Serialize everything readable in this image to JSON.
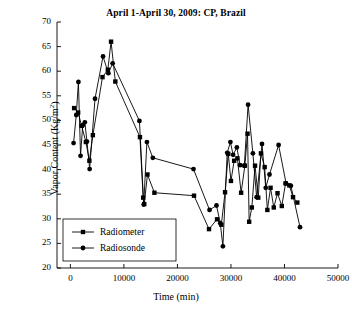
{
  "chart_data": {
    "type": "line",
    "title": "April 1-April 30, 2009: CP, Brazil",
    "xlabel": "Time (min)",
    "ylabel": "Vapor Content (Kg/m²)",
    "ylabel_main": "Vapor Content (Kg/m",
    "ylabel_sup": "2",
    "ylabel_tail": ")",
    "xlim": [
      -2500,
      50000
    ],
    "ylim": [
      20,
      70
    ],
    "grid": false,
    "legend_position": "lower-left",
    "xticks": [
      0,
      10000,
      20000,
      30000,
      40000,
      50000
    ],
    "xtick_labels": [
      "0",
      "10000",
      "20000",
      "30000",
      "40000",
      "50000"
    ],
    "yticks": [
      20,
      25,
      30,
      35,
      40,
      45,
      50,
      55,
      60,
      65,
      70
    ],
    "ytick_labels": [
      "20",
      "25",
      "30",
      "35",
      "40",
      "45",
      "50",
      "55",
      "60",
      "65",
      "70"
    ],
    "series": [
      {
        "name": "Radiometer",
        "marker": "square",
        "color": "#000000",
        "points": [
          [
            700,
            52.5
          ],
          [
            1450,
            51.6
          ],
          [
            2100,
            48.9
          ],
          [
            2900,
            45.6
          ],
          [
            3550,
            41.8
          ],
          [
            4200,
            47.0
          ],
          [
            6000,
            58.8
          ],
          [
            7000,
            60.3
          ],
          [
            7600,
            66.0
          ],
          [
            8400,
            57.9
          ],
          [
            13000,
            46.6
          ],
          [
            13600,
            34.3
          ],
          [
            13800,
            33.0
          ],
          [
            14400,
            39.0
          ],
          [
            15700,
            35.3
          ],
          [
            23100,
            34.7
          ],
          [
            25900,
            27.9
          ],
          [
            27400,
            29.9
          ],
          [
            28200,
            28.8
          ],
          [
            28900,
            35.4
          ],
          [
            29500,
            43.2
          ],
          [
            30000,
            37.7
          ],
          [
            30600,
            41.8
          ],
          [
            31200,
            42.3
          ],
          [
            31900,
            35.3
          ],
          [
            32600,
            40.8
          ],
          [
            33100,
            47.3
          ],
          [
            33400,
            29.4
          ],
          [
            33900,
            32.3
          ],
          [
            34500,
            40.8
          ],
          [
            35100,
            34.3
          ],
          [
            35600,
            43.3
          ],
          [
            36300,
            40.5
          ],
          [
            36800,
            31.8
          ],
          [
            37400,
            36.3
          ],
          [
            38000,
            32.3
          ],
          [
            38700,
            35.2
          ],
          [
            39500,
            32.6
          ],
          [
            40200,
            37.2
          ],
          [
            40900,
            36.8
          ],
          [
            41600,
            34.4
          ],
          [
            42400,
            33.3
          ]
        ]
      },
      {
        "name": "Radiosonde",
        "marker": "circle",
        "color": "#000000",
        "points": [
          [
            600,
            45.4
          ],
          [
            1100,
            51.1
          ],
          [
            1500,
            57.8
          ],
          [
            1900,
            42.8
          ],
          [
            2300,
            49.0
          ],
          [
            2700,
            49.6
          ],
          [
            3100,
            45.7
          ],
          [
            3600,
            40.1
          ],
          [
            4600,
            54.4
          ],
          [
            6100,
            63.0
          ],
          [
            7100,
            59.6
          ],
          [
            7900,
            61.6
          ],
          [
            12900,
            49.9
          ],
          [
            13700,
            32.9
          ],
          [
            14300,
            45.6
          ],
          [
            15400,
            42.4
          ],
          [
            23000,
            40.1
          ],
          [
            26000,
            31.8
          ],
          [
            27300,
            32.7
          ],
          [
            28000,
            29.1
          ],
          [
            28500,
            24.4
          ],
          [
            29300,
            43.4
          ],
          [
            29900,
            45.6
          ],
          [
            30400,
            43.0
          ],
          [
            31100,
            44.5
          ],
          [
            31700,
            40.9
          ],
          [
            32500,
            40.8
          ],
          [
            33200,
            53.2
          ],
          [
            34100,
            43.3
          ],
          [
            34800,
            34.4
          ],
          [
            35800,
            45.2
          ],
          [
            36500,
            36.3
          ],
          [
            37200,
            39.0
          ],
          [
            38900,
            45.0
          ],
          [
            40300,
            37.2
          ],
          [
            41200,
            36.7
          ],
          [
            42900,
            28.3
          ]
        ]
      }
    ]
  },
  "legend": {
    "items": [
      {
        "label": "Radiometer",
        "marker": "square"
      },
      {
        "label": "Radiosonde",
        "marker": "circle"
      }
    ]
  }
}
